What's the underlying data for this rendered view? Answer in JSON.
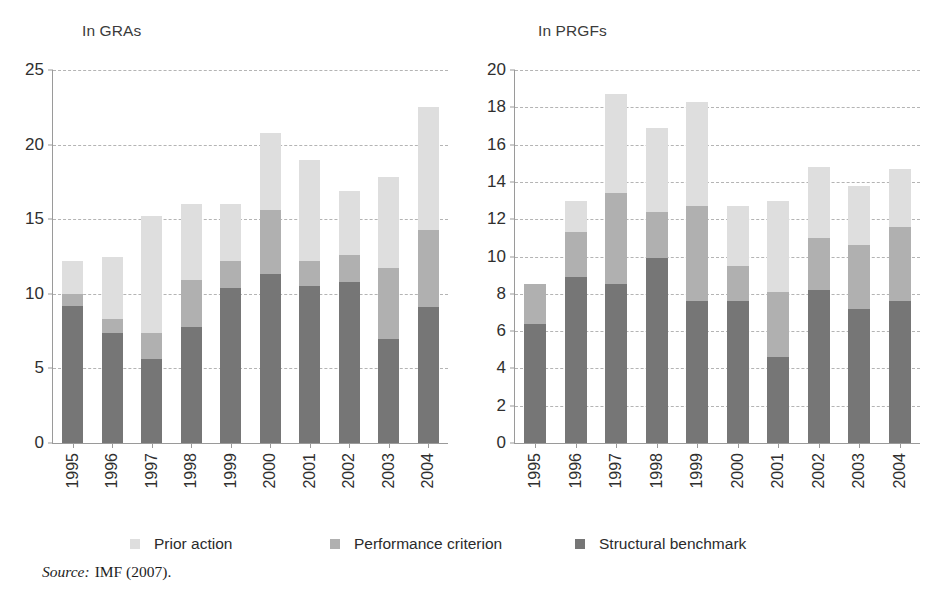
{
  "figure": {
    "source_label": "Source:",
    "source_text": "IMF (2007)."
  },
  "legend": {
    "items": [
      {
        "label": "Prior action",
        "color": "#dedede",
        "name": "prior-action"
      },
      {
        "label": "Performance criterion",
        "color": "#b0b0b0",
        "name": "performance-criterion"
      },
      {
        "label": "Structural benchmark",
        "color": "#767676",
        "name": "structural-benchmark"
      }
    ]
  },
  "colors": {
    "prior_action": "#dedede",
    "performance_criterion": "#b0b0b0",
    "structural_benchmark": "#767676",
    "axis": "#9a9a9a",
    "grid": "#b4b4b4",
    "text": "#2f2f2f"
  },
  "chart_data": [
    {
      "type": "bar",
      "id": "gras",
      "title": "In GRAs",
      "stacked": true,
      "xlabel": "",
      "ylabel": "",
      "ylim": [
        0,
        25
      ],
      "yticks": [
        0,
        5,
        10,
        15,
        20,
        25
      ],
      "grid": true,
      "legend_position": "bottom",
      "categories": [
        "1995",
        "1996",
        "1997",
        "1998",
        "1999",
        "2000",
        "2001",
        "2002",
        "2003",
        "2004"
      ],
      "series": [
        {
          "name": "Structural benchmark",
          "color": "#767676",
          "values": [
            9.2,
            7.4,
            5.6,
            7.8,
            10.4,
            11.3,
            10.5,
            10.8,
            7.0,
            9.1
          ]
        },
        {
          "name": "Performance criterion",
          "color": "#b0b0b0",
          "values": [
            0.8,
            0.9,
            1.8,
            3.1,
            1.8,
            4.3,
            1.7,
            1.8,
            4.7,
            5.2
          ]
        },
        {
          "name": "Prior action",
          "color": "#dedede",
          "values": [
            2.2,
            4.2,
            7.8,
            5.1,
            3.8,
            5.2,
            6.8,
            4.3,
            6.1,
            8.2
          ]
        }
      ],
      "totals": [
        12.2,
        12.5,
        15.2,
        16.0,
        16.0,
        20.8,
        19.0,
        16.9,
        17.8,
        22.5
      ]
    },
    {
      "type": "bar",
      "id": "prgfs",
      "title": "In PRGFs",
      "stacked": true,
      "xlabel": "",
      "ylabel": "",
      "ylim": [
        0,
        20
      ],
      "yticks": [
        0,
        2,
        4,
        6,
        8,
        10,
        12,
        14,
        16,
        18,
        20
      ],
      "grid": true,
      "legend_position": "bottom",
      "categories": [
        "1995",
        "1996",
        "1997",
        "1998",
        "1999",
        "2000",
        "2001",
        "2002",
        "2003",
        "2004"
      ],
      "series": [
        {
          "name": "Structural benchmark",
          "color": "#767676",
          "values": [
            6.4,
            8.9,
            8.5,
            9.9,
            7.6,
            7.6,
            4.6,
            8.2,
            7.2,
            7.6
          ]
        },
        {
          "name": "Performance criterion",
          "color": "#b0b0b0",
          "values": [
            2.1,
            2.4,
            4.9,
            2.5,
            5.1,
            1.9,
            3.5,
            2.8,
            3.4,
            4.0
          ]
        },
        {
          "name": "Prior action",
          "color": "#dedede",
          "values": [
            0.0,
            1.7,
            5.3,
            4.5,
            5.6,
            3.2,
            4.9,
            3.8,
            3.2,
            3.1
          ]
        }
      ],
      "totals": [
        8.5,
        13.0,
        18.7,
        16.9,
        18.3,
        12.7,
        13.0,
        14.8,
        13.8,
        14.7
      ]
    }
  ]
}
